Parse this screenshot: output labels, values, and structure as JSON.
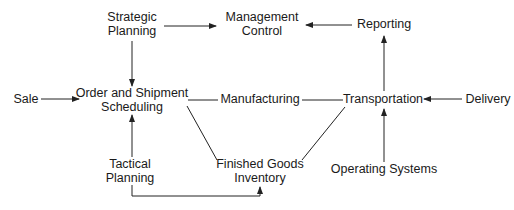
{
  "diagram": {
    "type": "flow",
    "colors": {
      "line": "#222222",
      "text": "#1a1a1a",
      "background": "#ffffff"
    },
    "nodes": {
      "strategic_planning": {
        "line1": "Strategic",
        "line2": "Planning"
      },
      "management_control": {
        "line1": "Management",
        "line2": "Control"
      },
      "reporting": {
        "line1": "Reporting"
      },
      "sale": {
        "line1": "Sale"
      },
      "order_shipment_scheduling": {
        "line1": "Order and Shipment",
        "line2": "Scheduling"
      },
      "manufacturing": {
        "line1": "Manufacturing"
      },
      "transportation": {
        "line1": "Transportation"
      },
      "delivery": {
        "line1": "Delivery"
      },
      "tactical_planning": {
        "line1": "Tactical",
        "line2": "Planning"
      },
      "finished_goods_inventory": {
        "line1": "Finished Goods",
        "line2": "Inventory"
      },
      "operating_systems": {
        "line1": "Operating Systems"
      }
    },
    "edges": [
      {
        "from": "Strategic Planning",
        "to": "Management Control",
        "arrow": true
      },
      {
        "from": "Reporting",
        "to": "Management Control",
        "arrow": true
      },
      {
        "from": "Strategic Planning",
        "to": "Order and Shipment Scheduling",
        "arrow": true
      },
      {
        "from": "Sale",
        "to": "Order and Shipment Scheduling",
        "arrow": true
      },
      {
        "from": "Order and Shipment Scheduling",
        "to": "Manufacturing",
        "arrow": false
      },
      {
        "from": "Manufacturing",
        "to": "Transportation",
        "arrow": false
      },
      {
        "from": "Delivery",
        "to": "Transportation",
        "arrow": true
      },
      {
        "from": "Transportation",
        "to": "Reporting",
        "arrow": true
      },
      {
        "from": "Operating Systems",
        "to": "Transportation",
        "arrow": true
      },
      {
        "from": "Tactical Planning",
        "to": "Order and Shipment Scheduling",
        "arrow": true
      },
      {
        "from": "Order and Shipment Scheduling",
        "to": "Finished Goods Inventory",
        "arrow": false
      },
      {
        "from": "Finished Goods Inventory",
        "to": "Transportation",
        "arrow": false
      },
      {
        "from": "Tactical Planning",
        "to": "Finished Goods Inventory",
        "arrow": true
      }
    ]
  }
}
